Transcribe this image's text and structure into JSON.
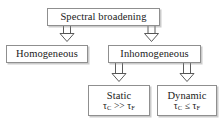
{
  "diagram": {
    "style": {
      "background": "#ffffff",
      "box_border": "#8f8f8f",
      "box_fill": "#ffffff",
      "shadow": "#8c8c8c",
      "text": "#1a1a1a",
      "arrow_stroke": "#4a4a4a",
      "arrow_fill": "#ffffff"
    },
    "nodes": {
      "root": {
        "label": "Spectral broadening"
      },
      "homogeneous": {
        "label": "Homogeneous"
      },
      "inhomogeneous": {
        "label": "Inhomogeneous"
      },
      "static": {
        "label": "Static",
        "formula_prefix": "τ",
        "formula_sub1": "C",
        "formula_operator": " >> ",
        "formula_tau2": "τ",
        "formula_sub2": "F"
      },
      "dynamic": {
        "label": "Dynamic",
        "formula_prefix": "τ",
        "formula_sub1": "C",
        "formula_operator": " ≤ ",
        "formula_tau2": "τ",
        "formula_sub2": "F"
      }
    },
    "edges": [
      {
        "from": "root",
        "to": "homogeneous"
      },
      {
        "from": "root",
        "to": "inhomogeneous"
      },
      {
        "from": "inhomogeneous",
        "to": "static"
      },
      {
        "from": "inhomogeneous",
        "to": "dynamic"
      }
    ]
  }
}
